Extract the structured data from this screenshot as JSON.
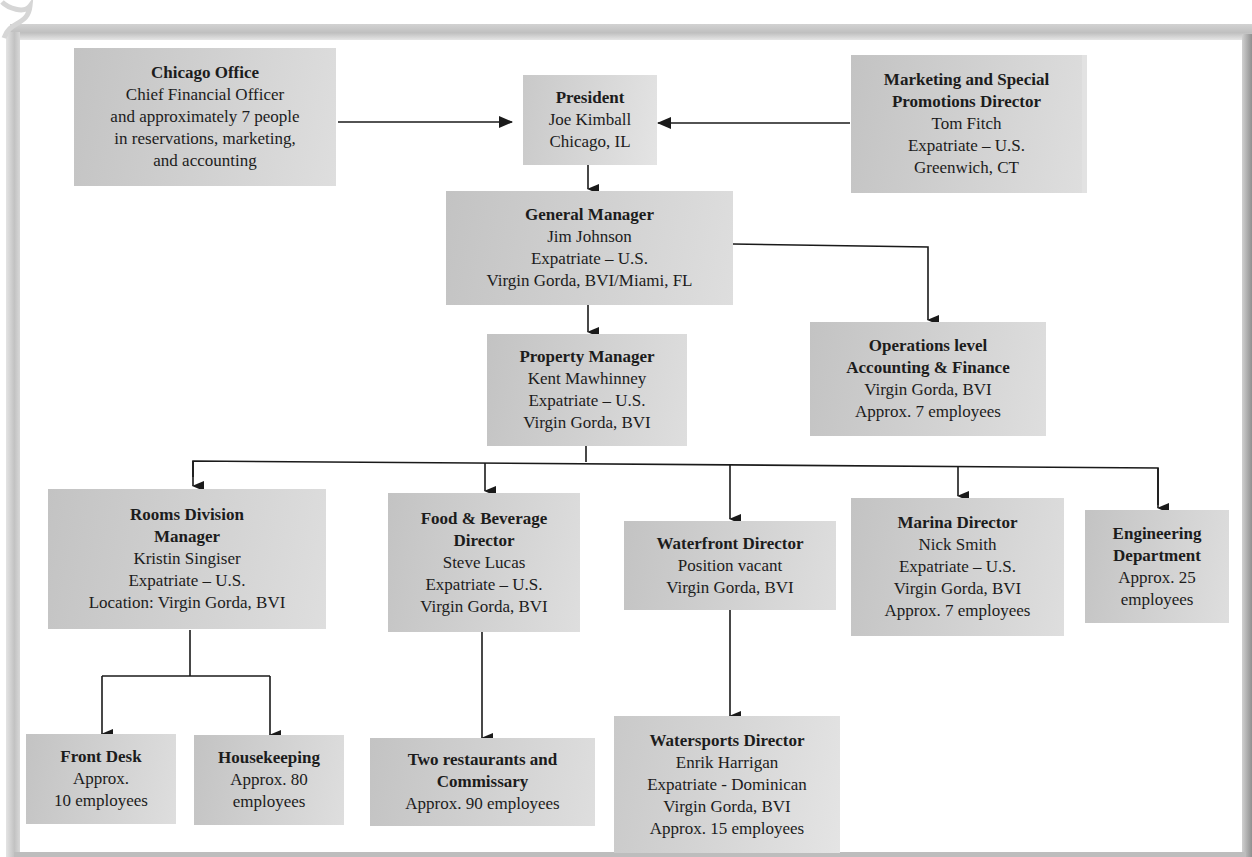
{
  "chart_title_fragment": ",",
  "nodes": {
    "chicago": {
      "title": "Chicago Office",
      "lines": [
        "Chief Financial Officer",
        "and approximately 7 people",
        "in reservations, marketing,",
        "and accounting"
      ]
    },
    "president": {
      "title": "President",
      "lines": [
        "Joe Kimball",
        "Chicago, IL"
      ]
    },
    "marketing": {
      "title_lines": [
        "Marketing and Special",
        "Promotions Director"
      ],
      "lines": [
        "Tom Fitch",
        "Expatriate – U.S.",
        "Greenwich, CT"
      ]
    },
    "general_manager": {
      "title": "General Manager",
      "lines": [
        "Jim Johnson",
        "Expatriate – U.S.",
        "Virgin Gorda, BVI/Miami, FL"
      ]
    },
    "operations_accounting": {
      "title_lines": [
        "Operations level",
        "Accounting & Finance"
      ],
      "lines": [
        "Virgin Gorda, BVI",
        "Approx. 7 employees"
      ]
    },
    "property_manager": {
      "title": "Property Manager",
      "lines": [
        "Kent Mawhinney",
        "Expatriate – U.S.",
        "Virgin Gorda, BVI"
      ]
    },
    "rooms_division": {
      "title_lines": [
        "Rooms Division",
        "Manager"
      ],
      "lines": [
        "Kristin Singiser",
        "Expatriate – U.S.",
        "Location:  Virgin Gorda, BVI"
      ]
    },
    "food_beverage": {
      "title_lines": [
        "Food & Beverage",
        "Director"
      ],
      "lines": [
        "Steve Lucas",
        "Expatriate – U.S.",
        "Virgin Gorda, BVI"
      ]
    },
    "waterfront": {
      "title": "Waterfront Director",
      "lines": [
        "Position vacant",
        "Virgin Gorda, BVI"
      ]
    },
    "marina": {
      "title": "Marina Director",
      "lines": [
        "Nick Smith",
        "Expatriate – U.S.",
        "Virgin Gorda, BVI",
        "Approx. 7 employees"
      ]
    },
    "engineering": {
      "title_lines": [
        "Engineering",
        "Department"
      ],
      "lines": [
        "Approx. 25",
        "employees"
      ]
    },
    "front_desk": {
      "title": "Front Desk",
      "lines": [
        "Approx.",
        "10 employees"
      ]
    },
    "housekeeping": {
      "title": "Housekeeping",
      "lines": [
        "Approx. 80",
        "employees"
      ]
    },
    "restaurants": {
      "title_lines": [
        "Two restaurants and",
        "Commissary"
      ],
      "lines": [
        "Approx. 90 employees"
      ]
    },
    "watersports": {
      "title": "Watersports Director",
      "lines": [
        "Enrik Harrigan",
        "Expatriate - Dominican",
        "Virgin Gorda, BVI",
        "Approx. 15 employees"
      ]
    }
  },
  "colors": {
    "box_fill": "#cfcfcf",
    "connector": "#1a1a1a",
    "frame": "#c0c0c0"
  }
}
